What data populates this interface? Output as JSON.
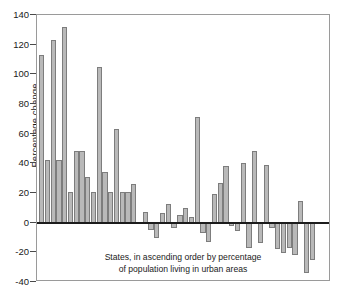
{
  "chart_data": {
    "type": "bar",
    "title": "",
    "subtitle": "",
    "xlabel": "",
    "ylabel": "Percentage change",
    "annotation_line1": "States, in ascending order by percentage",
    "annotation_line2": "of population living in urban areas",
    "ylim": [
      -40,
      140
    ],
    "ytick_labels": [
      "140",
      "120",
      "100",
      "80",
      "60",
      "40",
      "20",
      "0",
      "-20",
      "-40"
    ],
    "yticks": [
      140,
      120,
      100,
      80,
      60,
      40,
      20,
      0,
      -20,
      -40
    ],
    "grid": false,
    "legend": false,
    "xaxis_tick_labels_shown": false,
    "bar_fill_color": "#b9b9b9",
    "bar_edge_color": "#7d7d7d",
    "zero_line_color": "#1c1c1c",
    "frame_color": "#9a9a9a",
    "n_bars": 50,
    "categories": [
      "1",
      "2",
      "3",
      "4",
      "5",
      "6",
      "7",
      "8",
      "9",
      "10",
      "11",
      "12",
      "13",
      "14",
      "15",
      "16",
      "17",
      "18",
      "19",
      "20",
      "21",
      "22",
      "23",
      "24",
      "25",
      "26",
      "27",
      "28",
      "29",
      "30",
      "31",
      "32",
      "33",
      "34",
      "35",
      "36",
      "37",
      "38",
      "39",
      "40",
      "41",
      "42",
      "43",
      "44",
      "45",
      "46",
      "47",
      "48",
      "49",
      "50"
    ],
    "values": [
      113,
      42,
      123,
      42,
      132,
      21,
      48.5,
      48.5,
      31,
      21,
      105,
      34,
      21,
      63,
      21,
      20.5,
      26,
      0,
      7.5,
      -5,
      -10.5,
      6.5,
      12.5,
      -3.5,
      5,
      10,
      3.5,
      71.5,
      -7,
      -13,
      19,
      26.5,
      38,
      -2,
      -5.5,
      40.5,
      -17,
      48,
      -14,
      39,
      -3.5,
      -17.5,
      -20.5,
      -17,
      -22,
      14.5,
      -34,
      -25,
      0,
      0
    ]
  }
}
